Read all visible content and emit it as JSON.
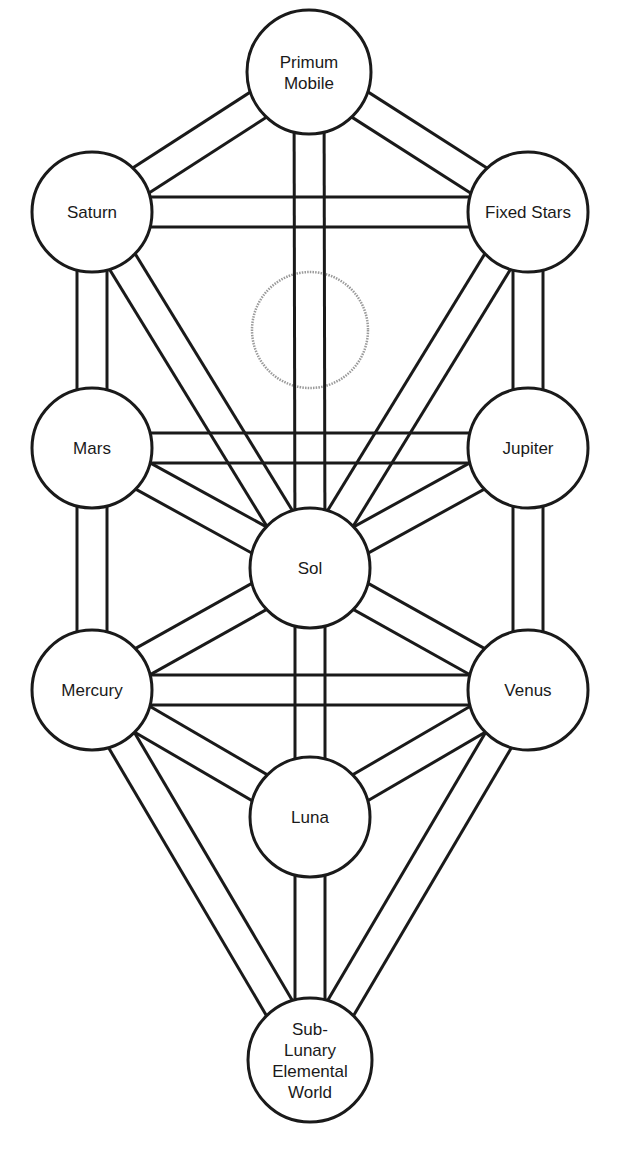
{
  "diagram": {
    "type": "tree-of-life",
    "colors": {
      "line": "#1a1a1a",
      "background": "#ffffff",
      "hidden_sphere": "#9a9a9a"
    },
    "nodes": [
      {
        "id": "primum-mobile",
        "lines": [
          "Primum",
          "Mobile"
        ],
        "cx": 309,
        "cy": 72,
        "r": 62
      },
      {
        "id": "saturn",
        "lines": [
          "Saturn"
        ],
        "cx": 92,
        "cy": 212,
        "r": 60
      },
      {
        "id": "fixed-stars",
        "lines": [
          "Fixed Stars"
        ],
        "cx": 528,
        "cy": 212,
        "r": 60
      },
      {
        "id": "mars",
        "lines": [
          "Mars"
        ],
        "cx": 92,
        "cy": 448,
        "r": 60
      },
      {
        "id": "jupiter",
        "lines": [
          "Jupiter"
        ],
        "cx": 528,
        "cy": 448,
        "r": 60
      },
      {
        "id": "sol",
        "lines": [
          "Sol"
        ],
        "cx": 310,
        "cy": 568,
        "r": 60
      },
      {
        "id": "mercury",
        "lines": [
          "Mercury"
        ],
        "cx": 92,
        "cy": 690,
        "r": 60
      },
      {
        "id": "venus",
        "lines": [
          "Venus"
        ],
        "cx": 528,
        "cy": 690,
        "r": 60
      },
      {
        "id": "luna",
        "lines": [
          "Luna"
        ],
        "cx": 310,
        "cy": 817,
        "r": 60
      },
      {
        "id": "sub-lunary",
        "lines": [
          "Sub-",
          "Lunary",
          "Elemental",
          "World"
        ],
        "cx": 310,
        "cy": 1060,
        "r": 62
      }
    ],
    "hidden_sphere": {
      "id": "daath",
      "cx": 310,
      "cy": 330,
      "r": 58
    },
    "paths": [
      [
        "primum-mobile",
        "saturn"
      ],
      [
        "primum-mobile",
        "fixed-stars"
      ],
      [
        "primum-mobile",
        "sol"
      ],
      [
        "saturn",
        "fixed-stars"
      ],
      [
        "saturn",
        "mars"
      ],
      [
        "saturn",
        "sol"
      ],
      [
        "fixed-stars",
        "jupiter"
      ],
      [
        "fixed-stars",
        "sol"
      ],
      [
        "mars",
        "jupiter"
      ],
      [
        "mars",
        "sol"
      ],
      [
        "mars",
        "mercury"
      ],
      [
        "jupiter",
        "sol"
      ],
      [
        "jupiter",
        "venus"
      ],
      [
        "sol",
        "mercury"
      ],
      [
        "sol",
        "venus"
      ],
      [
        "sol",
        "luna"
      ],
      [
        "mercury",
        "venus"
      ],
      [
        "mercury",
        "luna"
      ],
      [
        "mercury",
        "sub-lunary"
      ],
      [
        "venus",
        "luna"
      ],
      [
        "venus",
        "sub-lunary"
      ],
      [
        "luna",
        "sub-lunary"
      ]
    ],
    "path_width": 30
  }
}
